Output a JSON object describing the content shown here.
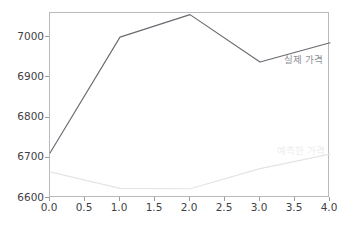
{
  "chart_data": {
    "type": "line",
    "title": "",
    "xlabel": "",
    "ylabel": "",
    "xlim": [
      0.0,
      4.0
    ],
    "ylim": [
      6600,
      7060
    ],
    "grid": false,
    "legend_position": "inline-annotation",
    "x": [
      0.0,
      1.0,
      2.0,
      3.0,
      4.0
    ],
    "xticks": [
      "0.0",
      "0.5",
      "1.0",
      "1.5",
      "2.0",
      "2.5",
      "3.0",
      "3.5",
      "4.0"
    ],
    "xtick_values": [
      0.0,
      0.5,
      1.0,
      1.5,
      2.0,
      2.5,
      3.0,
      3.5,
      4.0
    ],
    "yticks": [
      "6600",
      "6700",
      "6800",
      "6900",
      "7000"
    ],
    "ytick_values": [
      6600,
      6700,
      6800,
      6900,
      7000
    ],
    "series": [
      {
        "name": "실제 가격",
        "color": "#6a6a72",
        "values": [
          6712,
          7000,
          7056,
          6938,
          6986
        ],
        "annotation": {
          "text": "실제 가격",
          "x": 3.35,
          "y": 6942
        }
      },
      {
        "name": "예측한 가격",
        "color": "#e4e4e6",
        "values": [
          6665,
          6624,
          6623,
          6673,
          6709
        ],
        "annotation": {
          "text": "예측한 가격",
          "x": 3.25,
          "y": 6718
        }
      }
    ]
  },
  "figure": {
    "background_color": "#ffffff",
    "axes_border_color": "#b9b9bd",
    "tick_label_color": "#3f3f45"
  }
}
